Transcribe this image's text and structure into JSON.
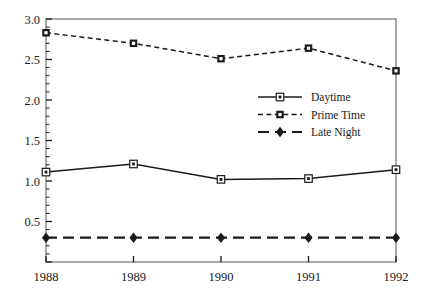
{
  "chart_data": {
    "type": "line",
    "title": "",
    "xlabel": "",
    "ylabel": "",
    "categories": [
      "1988",
      "1989",
      "1990",
      "1991",
      "1992"
    ],
    "x": [
      1988,
      1989,
      1990,
      1991,
      1992
    ],
    "xlim": [
      1988,
      1992
    ],
    "ylim": [
      0.0,
      3.0
    ],
    "yticks": [
      0.0,
      0.5,
      1.0,
      1.5,
      2.0,
      2.5,
      3.0
    ],
    "ytick_labels": [
      "",
      "0.5",
      "1.0",
      "1.5",
      "2.0",
      "2.5",
      "3.0"
    ],
    "minor_ytick_interval": 0.1,
    "grid": false,
    "legend_position": "center-right-inside",
    "series": [
      {
        "name": "Daytime",
        "values": [
          1.11,
          1.21,
          1.02,
          1.03,
          1.14
        ],
        "line_style": "solid",
        "marker": "square-open-dot",
        "color": "#1a1a1a"
      },
      {
        "name": "Prime Time",
        "values": [
          2.83,
          2.7,
          2.51,
          2.64,
          2.36
        ],
        "line_style": "dashed",
        "marker": "square-filled",
        "color": "#1a1a1a"
      },
      {
        "name": "Late Night",
        "values": [
          0.3,
          0.3,
          0.3,
          0.3,
          0.3
        ],
        "line_style": "long-dashed",
        "marker": "diamond-filled",
        "color": "#1a1a1a"
      }
    ]
  },
  "axes": {
    "y_tick_labels": [
      "3.0",
      "2.5",
      "2.0",
      "1.5",
      "1.0",
      "0.5"
    ],
    "x_tick_labels": [
      "1988",
      "1989",
      "1990",
      "1991",
      "1992"
    ]
  },
  "legend": {
    "entries": [
      {
        "label": "Daytime"
      },
      {
        "label": "Prime Time"
      },
      {
        "label": "Late Night"
      }
    ]
  },
  "colors": {
    "ink": "#1a1a1a",
    "frame": "#6e6e6e",
    "background": "#ffffff"
  }
}
